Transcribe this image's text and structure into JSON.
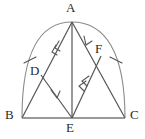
{
  "figure": {
    "type": "geometry-diagram",
    "canvas": {
      "width": 145,
      "height": 139
    },
    "colors": {
      "stroke": "#555555",
      "label": "#2b2b2b",
      "background": "#ffffff",
      "arc_stroke": "#888888",
      "base_stroke": "#777777"
    },
    "points": [
      {
        "id": "A",
        "label": "A",
        "x": 72,
        "y": 22,
        "label_x": 68,
        "label_y": 2
      },
      {
        "id": "B",
        "label": "B",
        "x": 22,
        "y": 118,
        "label_x": 6,
        "label_y": 110
      },
      {
        "id": "C",
        "label": "C",
        "x": 125,
        "y": 118,
        "label_x": 131,
        "label_y": 110
      },
      {
        "id": "D",
        "label": "D",
        "x": 41,
        "y": 75,
        "label_x": 32,
        "label_y": 66
      },
      {
        "id": "E",
        "label": "E",
        "x": 72,
        "y": 118,
        "label_x": 66,
        "label_y": 122
      },
      {
        "id": "F",
        "label": "F",
        "x": 101,
        "y": 56,
        "label_x": 96,
        "label_y": 44
      }
    ],
    "segments": [
      {
        "id": "AB",
        "from": "A",
        "to": "B",
        "name": "side-ab"
      },
      {
        "id": "AC",
        "from": "A",
        "to": "C",
        "name": "side-ac"
      },
      {
        "id": "BC",
        "from": "B",
        "to": "C",
        "name": "side-bc"
      },
      {
        "id": "AE",
        "from": "A",
        "to": "E",
        "name": "cevian-ae"
      },
      {
        "id": "DE",
        "from": "D",
        "to": "E",
        "name": "segment-de"
      },
      {
        "id": "EF",
        "from": "E",
        "to": "F",
        "name": "segment-ef"
      }
    ],
    "arc": {
      "name": "arc-b-a-c",
      "from": "B",
      "to": "C",
      "apex": "A",
      "description": "arc passing from B through A to C"
    },
    "arrow_marks": [
      {
        "on": "AB",
        "style": "double-chevron",
        "name": "parallel-mark-ab"
      },
      {
        "on": "AE",
        "style": "single-chevron",
        "name": "parallel-mark-ae"
      },
      {
        "on": "DE",
        "style": "single-chevron",
        "name": "parallel-mark-de"
      },
      {
        "on": "EF",
        "style": "double-chevron",
        "name": "parallel-mark-ef"
      }
    ],
    "tick_marks": [
      {
        "on": "arc-left",
        "count": 1,
        "name": "congruence-tick-left"
      },
      {
        "on": "arc-right",
        "count": 1,
        "name": "congruence-tick-right"
      }
    ]
  }
}
